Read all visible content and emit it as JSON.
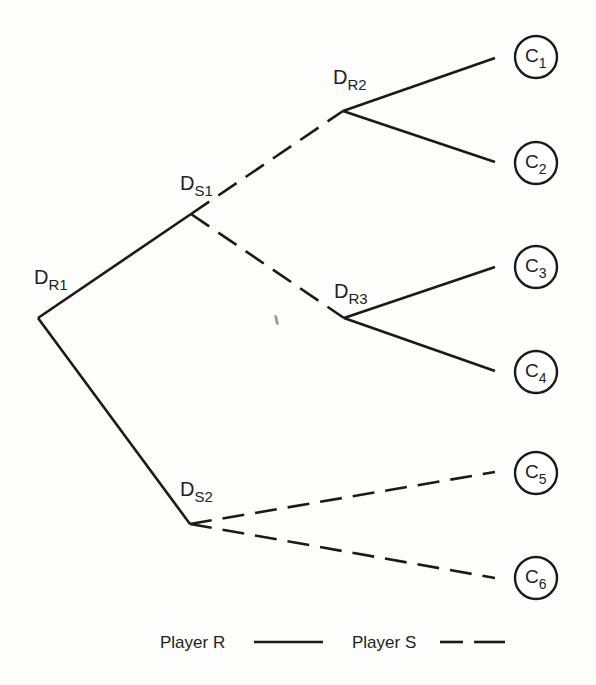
{
  "diagram": {
    "type": "game-tree",
    "nodes": [
      {
        "id": "DR1",
        "main": "D",
        "sub": "R1",
        "x": 38,
        "y": 318,
        "player": "R",
        "label_x": 34,
        "label_y": 284
      },
      {
        "id": "DS1",
        "main": "D",
        "sub": "S1",
        "x": 191,
        "y": 214,
        "player": "S",
        "label_x": 180,
        "label_y": 190
      },
      {
        "id": "DS2",
        "main": "D",
        "sub": "S2",
        "x": 190,
        "y": 524,
        "player": "S",
        "label_x": 180,
        "label_y": 496
      },
      {
        "id": "DR2",
        "main": "D",
        "sub": "R2",
        "x": 343,
        "y": 111,
        "player": "R",
        "label_x": 333,
        "label_y": 84
      },
      {
        "id": "DR3",
        "main": "D",
        "sub": "R3",
        "x": 344,
        "y": 318,
        "player": "R",
        "label_x": 334,
        "label_y": 298
      }
    ],
    "outcomes": [
      {
        "id": "C1",
        "main": "C",
        "sub": "1",
        "cx": 536,
        "cy": 57
      },
      {
        "id": "C2",
        "main": "C",
        "sub": "2",
        "cx": 536,
        "cy": 163
      },
      {
        "id": "C3",
        "main": "C",
        "sub": "3",
        "cx": 536,
        "cy": 267
      },
      {
        "id": "C4",
        "main": "C",
        "sub": "4",
        "cx": 536,
        "cy": 372
      },
      {
        "id": "C5",
        "main": "C",
        "sub": "5",
        "cx": 536,
        "cy": 473
      },
      {
        "id": "C6",
        "main": "C",
        "sub": "6",
        "cx": 536,
        "cy": 578
      }
    ],
    "edges": [
      {
        "from": "DR1",
        "to": "DS1",
        "style": "solid",
        "x1": 38,
        "y1": 318,
        "x2": 191,
        "y2": 214
      },
      {
        "from": "DR1",
        "to": "DS2",
        "style": "solid",
        "x1": 38,
        "y1": 318,
        "x2": 190,
        "y2": 524
      },
      {
        "from": "DS1",
        "to": "DR2",
        "style": "dashed",
        "x1": 191,
        "y1": 214,
        "x2": 343,
        "y2": 111
      },
      {
        "from": "DS1",
        "to": "DR3",
        "style": "dashed",
        "x1": 191,
        "y1": 214,
        "x2": 344,
        "y2": 318
      },
      {
        "from": "DR2",
        "to": "C1",
        "style": "solid",
        "x1": 343,
        "y1": 111,
        "x2": 495,
        "y2": 58
      },
      {
        "from": "DR2",
        "to": "C2",
        "style": "solid",
        "x1": 343,
        "y1": 111,
        "x2": 495,
        "y2": 162
      },
      {
        "from": "DR3",
        "to": "C3",
        "style": "solid",
        "x1": 344,
        "y1": 318,
        "x2": 495,
        "y2": 267
      },
      {
        "from": "DR3",
        "to": "C4",
        "style": "solid",
        "x1": 344,
        "y1": 318,
        "x2": 495,
        "y2": 371
      },
      {
        "from": "DS2",
        "to": "C5",
        "style": "dashed",
        "x1": 190,
        "y1": 524,
        "x2": 495,
        "y2": 472
      },
      {
        "from": "DS2",
        "to": "C6",
        "style": "dashed",
        "x1": 190,
        "y1": 524,
        "x2": 495,
        "y2": 578
      }
    ],
    "colors": {
      "ink": "#1a1a1a",
      "background": "#ffffff"
    }
  },
  "legend": {
    "player_r": {
      "label": "Player R",
      "line_style": "solid"
    },
    "player_s": {
      "label": "Player S",
      "line_style": "dashed"
    }
  }
}
